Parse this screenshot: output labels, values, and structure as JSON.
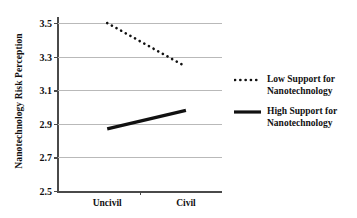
{
  "chart_data": {
    "type": "line",
    "title": "",
    "xlabel": "",
    "ylabel": "Nanotechnology Risk Perception",
    "categories": [
      "Uncivil",
      "Civil"
    ],
    "ylim": [
      2.5,
      3.5
    ],
    "yticks": [
      "2.5",
      "2.7",
      "2.9",
      "3.1",
      "3.3",
      "3.5"
    ],
    "ytick_values": [
      2.5,
      2.7,
      2.9,
      3.1,
      3.3,
      3.5
    ],
    "grid": true,
    "legend_position": "right",
    "series": [
      {
        "name": "Low Support for Nanotechnology",
        "style": "dotted",
        "color": "#111111",
        "values": [
          3.5,
          3.24
        ]
      },
      {
        "name": "High Support for Nanotechnology",
        "style": "solid",
        "color": "#111111",
        "values": [
          2.87,
          2.98
        ]
      }
    ]
  },
  "legend": {
    "items": [
      {
        "label_line1": "Low Support for",
        "label_line2": "Nanotechnology",
        "marker": "dotted-line-marker"
      },
      {
        "label_line1": "High Support for",
        "label_line2": "Nanotechnology",
        "marker": "solid-line-marker"
      }
    ]
  }
}
